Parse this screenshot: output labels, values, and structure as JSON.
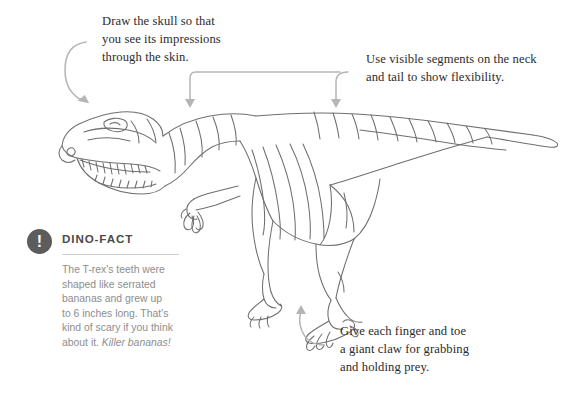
{
  "page": {
    "background_color": "#ffffff",
    "ink_color": "#6f6f6f",
    "annotation_bar_color": "#c9c9c9",
    "arrow_color": "#b5b5b5",
    "callout_text_color": "#2b2b2b",
    "fact_text_color": "#8d8d8d",
    "fact_icon_color": "#5c5c5c"
  },
  "illustration": {
    "subject": "tyrannosaurus-rex-line-drawing",
    "style": "pencil-sketch-outline"
  },
  "callouts": [
    {
      "id": "skull",
      "text": "Draw the skull so that\nyou see its impressions\nthrough the skin.",
      "points_to": "skull"
    },
    {
      "id": "segments",
      "text": "Use visible segments on the neck\nand tail to show flexibility.",
      "points_to": "neck-and-tail"
    },
    {
      "id": "claws",
      "text": "Give each finger and toe\na giant claw for grabbing\nand holding prey.",
      "points_to": "foot"
    }
  ],
  "dino_fact": {
    "icon": "exclamation-icon",
    "icon_glyph": "!",
    "title": "DINO-FACT",
    "body": "The T-rex's teeth were\nshaped like serrated\nbananas and grew up\nto 6 inches long. That's\nkind of scary if you think\nabout it. ",
    "kicker": "Killer bananas!"
  }
}
